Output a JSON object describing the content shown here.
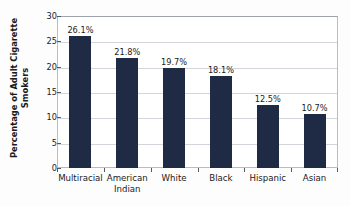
{
  "chart_data": {
    "type": "bar",
    "title": "",
    "subtitle": "",
    "xlabel": "",
    "ylabel_line1": "Percentage of Adult Cigarette",
    "ylabel_line2": "Smokers",
    "categories": [
      "Multiracial",
      "American Indian",
      "White",
      "Black",
      "Hispanic",
      "Asian"
    ],
    "category_lines": [
      {
        "line1": "Multiracial",
        "line2": ""
      },
      {
        "line1": "American",
        "line2": "Indian"
      },
      {
        "line1": "White",
        "line2": ""
      },
      {
        "line1": "Black",
        "line2": ""
      },
      {
        "line1": "Hispanic",
        "line2": ""
      },
      {
        "line1": "Asian",
        "line2": ""
      }
    ],
    "values": [
      26.1,
      21.8,
      19.7,
      18.1,
      12.5,
      10.7
    ],
    "data_labels": [
      "26.1%",
      "21.8%",
      "19.7%",
      "18.1%",
      "12.5%",
      "10.7%"
    ],
    "ylim": [
      0,
      30
    ],
    "ytick_values": [
      0,
      5,
      10,
      15,
      20,
      25,
      30
    ],
    "ytick_labels": [
      "0",
      "5",
      "10",
      "15",
      "20",
      "25",
      "30"
    ],
    "grid": true,
    "legend": false,
    "bar_color": "#1f2a44",
    "gridline_color": "#d2d5dc",
    "plot_border_color": "#b9bcc4",
    "background_color": "#fdfdfd",
    "text_color": "#1a1a1a"
  }
}
